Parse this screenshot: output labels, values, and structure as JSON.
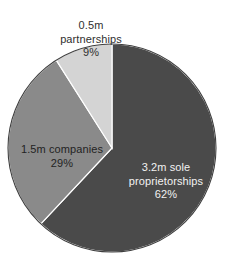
{
  "chart_data": {
    "type": "pie",
    "title": "",
    "subtitle": "",
    "xlabel": "",
    "ylabel": "",
    "legend_position": "none",
    "grid": false,
    "start_angle_deg": 0,
    "direction": "clockwise",
    "categories": [
      "sole proprietorships",
      "companies",
      "partnerships"
    ],
    "values": [
      62,
      29,
      9
    ],
    "value_unit": "percent",
    "labels": [
      "3.2m sole proprietorships 62%",
      "1.5m companies 29%",
      "0.5m partnerships 9%"
    ],
    "colors": [
      "#4a4a4a",
      "#8a8a8a",
      "#d4d4d4"
    ],
    "slices": [
      {
        "name": "sole proprietorships",
        "count_label": "3.2m",
        "entity_label": "sole proprietorships",
        "percent_label": "62%",
        "percent": 62,
        "color": "#4a4a4a",
        "label_color": "#f2f2f2"
      },
      {
        "name": "companies",
        "count_label": "1.5m",
        "entity_label": "companies",
        "percent_label": "29%",
        "percent": 29,
        "color": "#8a8a8a",
        "label_color": "#232323"
      },
      {
        "name": "partnerships",
        "count_label": "0.5m",
        "entity_label": "partnerships",
        "percent_label": "9%",
        "percent": 9,
        "color": "#d4d4d4",
        "label_color": "#2f2f2f"
      }
    ]
  },
  "labels": {
    "partnerships": {
      "line1": "0.5m",
      "line2": "partnerships",
      "percent": "9%",
      "text": "0.5m\npartnerships"
    },
    "companies": {
      "line1": "1.5m companies",
      "percent": "29%",
      "text": "1.5m companies"
    },
    "sole": {
      "line1": "3.2m sole",
      "line2": "proprietorships",
      "percent": "62%",
      "text": "3.2m sole\nproprietorships"
    }
  },
  "style": {
    "background": "#ffffff",
    "slice_border": "#ffffff",
    "outline": "#3a3a3a"
  }
}
